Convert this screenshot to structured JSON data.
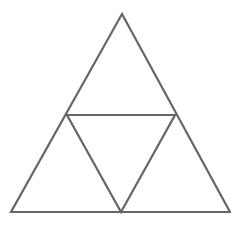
{
  "diagram": {
    "type": "subdivided-triangle",
    "stroke_color": "#666666",
    "stroke_width": 2.2,
    "background": "#ffffff",
    "vertices": {
      "apex": [
        122,
        14
      ],
      "bottom_left": [
        11,
        212
      ],
      "bottom_right": [
        230,
        212
      ],
      "mid_left": [
        67,
        115
      ],
      "mid_right": [
        175,
        115
      ],
      "mid_bottom": [
        121,
        212
      ]
    },
    "sub_triangles": [
      "top",
      "bottom-left",
      "center-inverted",
      "bottom-right"
    ]
  }
}
